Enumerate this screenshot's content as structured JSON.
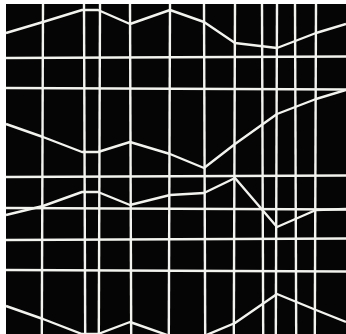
{
  "artwork": {
    "description": "Abstract geometric composition: white lines on black ground forming a distorted grid with zigzag diagonals",
    "background_color": "#050505",
    "line_color": "#f2f2ee",
    "margin_color": "#ffffff",
    "frame": {
      "x": 6,
      "y": 4,
      "width": 340,
      "height": 330
    },
    "vertical_lines_x": [
      43,
      84,
      100,
      130,
      170,
      204,
      235,
      262,
      277,
      295,
      316
    ],
    "horizontal_lines_y": [
      58,
      88,
      177,
      208,
      240,
      270
    ],
    "zigzags": [
      {
        "points": [
          [
            6,
            33
          ],
          [
            43,
            22
          ],
          [
            82,
            10
          ],
          [
            98,
            10
          ],
          [
            130,
            24
          ],
          [
            170,
            10
          ],
          [
            204,
            22
          ],
          [
            235,
            43
          ],
          [
            277,
            48
          ],
          [
            316,
            33
          ],
          [
            346,
            24
          ]
        ]
      },
      {
        "points": [
          [
            6,
            124
          ],
          [
            43,
            137
          ],
          [
            82,
            152
          ],
          [
            98,
            152
          ],
          [
            130,
            142
          ],
          [
            170,
            154
          ],
          [
            204,
            168
          ],
          [
            235,
            144
          ],
          [
            277,
            114
          ],
          [
            316,
            99
          ],
          [
            346,
            90
          ]
        ]
      },
      {
        "points": [
          [
            6,
            215
          ],
          [
            43,
            206
          ],
          [
            82,
            192
          ],
          [
            98,
            192
          ],
          [
            130,
            205
          ],
          [
            170,
            195
          ],
          [
            204,
            193
          ],
          [
            235,
            178
          ],
          [
            277,
            227
          ],
          [
            316,
            210
          ],
          [
            346,
            209
          ]
        ]
      },
      {
        "points": [
          [
            6,
            306
          ],
          [
            43,
            319
          ],
          [
            82,
            334
          ],
          [
            98,
            334
          ],
          [
            130,
            322
          ],
          [
            170,
            336
          ],
          [
            204,
            336
          ],
          [
            235,
            323
          ],
          [
            277,
            294
          ],
          [
            316,
            310
          ],
          [
            346,
            322
          ]
        ]
      }
    ]
  }
}
